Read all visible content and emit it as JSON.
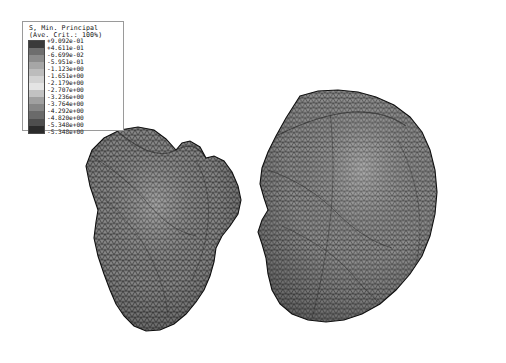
{
  "view": {
    "background": "#ffffff",
    "width": 506,
    "height": 363,
    "software_style": "abaqus-contour-plot"
  },
  "legend": {
    "title_line1": "S, Min. Principal",
    "title_line2": "(Ave. Crit.: 100%)",
    "colormap": "grayscale",
    "swatch_colors": [
      "#3a3a3a",
      "#6e6e6e",
      "#8c8c8c",
      "#a6a6a6",
      "#bcbcbc",
      "#d2d2d2",
      "#e4e4e4",
      "#c2c2c2",
      "#a0a0a0",
      "#868686",
      "#6a6a6a",
      "#4e4e4e",
      "#2b2b2b"
    ],
    "values": [
      "+9.092e-01",
      "+4.611e-01",
      "-6.699e-02",
      "-5.951e-01",
      "-1.123e+00",
      "-1.651e+00",
      "-2.179e+00",
      "-2.707e+00",
      "-3.236e+00",
      "-3.764e+00",
      "-4.292e+00",
      "-4.820e+00",
      "-5.348e+00",
      "-5.348e+00"
    ]
  },
  "chart_data": {
    "type": "heatmap",
    "title": "S, Min. Principal",
    "subtitle": "(Ave. Crit.: 100%)",
    "colorbar_label": "S, Min. Principal",
    "vmax": 0.9092,
    "vmin": -5.348,
    "contour_levels": [
      0.9092,
      0.4611,
      -0.06699,
      -0.5951,
      -1.123,
      -1.651,
      -2.179,
      -2.707,
      -3.236,
      -3.764,
      -4.292,
      -4.82,
      -5.348
    ],
    "level_step": 0.528,
    "units": "MPa",
    "colormap": "grayscale",
    "legend_position": "top-left",
    "grid": false,
    "xlabel": "",
    "ylabel": "",
    "objects": [
      {
        "name": "left-mesh-body",
        "mesh_type": "triangular-surface-mesh",
        "bbox": [
          80,
          125,
          170,
          210
        ],
        "fill_tone": "#6f6f6f"
      },
      {
        "name": "right-mesh-body",
        "mesh_type": "triangular-surface-mesh",
        "bbox": [
          258,
          90,
          182,
          240
        ],
        "fill_tone": "#737373"
      }
    ]
  },
  "meshes": {
    "left": {
      "name": "left-mesh-body",
      "outline": "M 98,210 L 90,186 L 86,166 L 92,150 L 104,138 L 120,130 L 138,127 L 154,130 L 166,139 L 176,150 L 182,143 L 190,141 L 200,147 L 206,158 L 214,156 L 224,161 L 232,172 L 238,186 L 241,200 L 238,214 L 230,226 L 222,236 L 216,248 L 214,262 L 210,276 L 204,290 L 196,302 L 186,314 L 174,324 L 160,330 L 146,331 L 134,326 L 124,316 L 116,304 L 110,290 L 104,274 L 98,256 L 94,238 L 96,222 Z"
    },
    "right": {
      "name": "right-mesh-body",
      "outline": "M 300,96 L 318,91 L 338,90 L 358,92 L 376,97 L 394,105 L 410,117 L 422,132 L 430,150 L 435,170 L 437,192 L 435,214 L 430,236 L 422,256 L 410,274 L 396,290 L 380,304 L 362,314 L 344,320 L 326,322 L 308,320 L 292,314 L 280,304 L 272,290 L 268,274 L 266,258 L 262,244 L 258,232 L 262,220 L 268,210 L 264,198 L 260,184 L 262,168 L 268,152 L 276,136 L 286,118 Z"
    }
  }
}
